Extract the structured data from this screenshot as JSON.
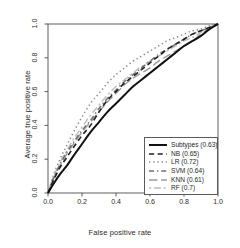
{
  "chart_data": {
    "type": "line",
    "title": "",
    "xlabel": "False positive rate",
    "ylabel": "Average true positive rate",
    "xlim": [
      0.0,
      1.0
    ],
    "ylim": [
      0.0,
      1.0
    ],
    "grid": false,
    "legend_position": "bottom-right",
    "xticks": [
      "0.0",
      "0.2",
      "0.4",
      "0.6",
      "0.8",
      "1.0"
    ],
    "yticks": [
      "0.0",
      "0.2",
      "0.4",
      "0.6",
      "0.8",
      "1.0"
    ],
    "series": [
      {
        "name": "Subtypes",
        "auc": "0.63",
        "legend_label": "Subtypes (0.63)",
        "color": "#111111",
        "linestyle": "solid",
        "linewidth": 2.0,
        "x": [
          0.0,
          0.03,
          0.07,
          0.11,
          0.15,
          0.2,
          0.25,
          0.3,
          0.35,
          0.4,
          0.45,
          0.5,
          0.55,
          0.6,
          0.65,
          0.7,
          0.75,
          0.8,
          0.85,
          0.9,
          0.95,
          1.0
        ],
        "y": [
          0.0,
          0.05,
          0.11,
          0.16,
          0.22,
          0.29,
          0.36,
          0.42,
          0.48,
          0.53,
          0.58,
          0.63,
          0.67,
          0.71,
          0.75,
          0.79,
          0.83,
          0.87,
          0.9,
          0.93,
          0.97,
          1.0
        ]
      },
      {
        "name": "NB",
        "auc": "0.65",
        "legend_label": "NB (0.65)",
        "color": "#222222",
        "linestyle": "dashed",
        "linewidth": 1.6,
        "x": [
          0.0,
          0.03,
          0.07,
          0.11,
          0.15,
          0.2,
          0.25,
          0.3,
          0.35,
          0.4,
          0.45,
          0.5,
          0.55,
          0.6,
          0.65,
          0.7,
          0.75,
          0.8,
          0.85,
          0.9,
          0.95,
          1.0
        ],
        "y": [
          0.0,
          0.07,
          0.15,
          0.21,
          0.27,
          0.34,
          0.4,
          0.48,
          0.55,
          0.6,
          0.65,
          0.69,
          0.73,
          0.77,
          0.81,
          0.85,
          0.88,
          0.91,
          0.94,
          0.96,
          0.98,
          1.0
        ]
      },
      {
        "name": "LR",
        "auc": "0.72",
        "legend_label": "LR (0.72)",
        "color": "#8a8a8a",
        "linestyle": "dotted",
        "linewidth": 1.5,
        "x": [
          0.0,
          0.03,
          0.07,
          0.11,
          0.15,
          0.2,
          0.25,
          0.3,
          0.35,
          0.4,
          0.45,
          0.5,
          0.55,
          0.6,
          0.65,
          0.7,
          0.75,
          0.8,
          0.85,
          0.9,
          0.95,
          1.0
        ],
        "y": [
          0.0,
          0.1,
          0.2,
          0.28,
          0.36,
          0.45,
          0.53,
          0.59,
          0.65,
          0.7,
          0.74,
          0.78,
          0.81,
          0.84,
          0.87,
          0.9,
          0.92,
          0.94,
          0.96,
          0.97,
          0.99,
          1.0
        ]
      },
      {
        "name": "SVM",
        "auc": "0.64",
        "legend_label": "SVM (0.64)",
        "color": "#707070",
        "linestyle": "dashdot",
        "linewidth": 1.5,
        "x": [
          0.0,
          0.03,
          0.07,
          0.11,
          0.15,
          0.2,
          0.25,
          0.3,
          0.35,
          0.4,
          0.45,
          0.5,
          0.55,
          0.6,
          0.65,
          0.7,
          0.75,
          0.8,
          0.85,
          0.9,
          0.95,
          1.0
        ],
        "y": [
          0.0,
          0.08,
          0.17,
          0.24,
          0.3,
          0.37,
          0.43,
          0.5,
          0.56,
          0.61,
          0.66,
          0.7,
          0.74,
          0.78,
          0.82,
          0.85,
          0.88,
          0.91,
          0.94,
          0.96,
          0.98,
          1.0
        ]
      },
      {
        "name": "KNN",
        "auc": "0.61",
        "legend_label": "KNN (0.61)",
        "color": "#9c9c9c",
        "linestyle": "longdash",
        "linewidth": 1.4,
        "x": [
          0.0,
          0.03,
          0.07,
          0.11,
          0.15,
          0.2,
          0.25,
          0.3,
          0.35,
          0.4,
          0.45,
          0.5,
          0.55,
          0.6,
          0.65,
          0.7,
          0.75,
          0.8,
          0.85,
          0.9,
          0.95,
          1.0
        ],
        "y": [
          0.0,
          0.08,
          0.16,
          0.23,
          0.29,
          0.36,
          0.42,
          0.48,
          0.54,
          0.59,
          0.64,
          0.68,
          0.71,
          0.74,
          0.78,
          0.81,
          0.84,
          0.87,
          0.9,
          0.94,
          0.97,
          1.0
        ]
      },
      {
        "name": "RF",
        "auc": "0.7",
        "legend_label": "RF (0.7)",
        "color": "#bdbdbd",
        "linestyle": "twodash",
        "linewidth": 1.4,
        "x": [
          0.0,
          0.03,
          0.07,
          0.11,
          0.15,
          0.2,
          0.25,
          0.3,
          0.35,
          0.4,
          0.45,
          0.5,
          0.55,
          0.6,
          0.65,
          0.7,
          0.75,
          0.8,
          0.85,
          0.9,
          0.95,
          1.0
        ],
        "y": [
          0.0,
          0.09,
          0.18,
          0.25,
          0.32,
          0.39,
          0.46,
          0.52,
          0.58,
          0.63,
          0.67,
          0.71,
          0.75,
          0.78,
          0.81,
          0.84,
          0.87,
          0.9,
          0.92,
          0.95,
          0.98,
          1.0
        ]
      }
    ]
  },
  "axes": {
    "frame_color": "#4d4d4d"
  }
}
